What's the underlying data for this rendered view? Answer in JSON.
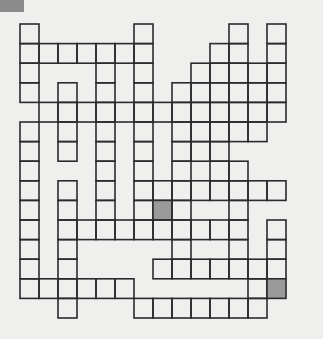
{
  "puzzle": {
    "type": "crossword-grid",
    "cols": 15,
    "rows": 15,
    "origin": [
      20,
      24
    ],
    "cell_w": 19,
    "cell_h": 19.6,
    "line_color": "#2b2b2b",
    "shade_color": "#9a9a9a",
    "corner_marker_color": "#8a8a8a",
    "shaded_cells": [
      [
        7,
        9
      ],
      [
        13,
        13
      ]
    ],
    "cells": [
      [
        0,
        0
      ],
      [
        6,
        0
      ],
      [
        11,
        0
      ],
      [
        13,
        0
      ],
      [
        0,
        1
      ],
      [
        1,
        1
      ],
      [
        2,
        1
      ],
      [
        3,
        1
      ],
      [
        4,
        1
      ],
      [
        5,
        1
      ],
      [
        6,
        1
      ],
      [
        10,
        1
      ],
      [
        11,
        1
      ],
      [
        13,
        1
      ],
      [
        0,
        2
      ],
      [
        4,
        2
      ],
      [
        6,
        2
      ],
      [
        9,
        2
      ],
      [
        10,
        2
      ],
      [
        11,
        2
      ],
      [
        12,
        2
      ],
      [
        13,
        2
      ],
      [
        0,
        3
      ],
      [
        2,
        3
      ],
      [
        4,
        3
      ],
      [
        6,
        3
      ],
      [
        8,
        3
      ],
      [
        9,
        3
      ],
      [
        10,
        3
      ],
      [
        11,
        3
      ],
      [
        12,
        3
      ],
      [
        13,
        3
      ],
      [
        1,
        4
      ],
      [
        2,
        4
      ],
      [
        3,
        4
      ],
      [
        4,
        4
      ],
      [
        5,
        4
      ],
      [
        6,
        4
      ],
      [
        7,
        4
      ],
      [
        8,
        4
      ],
      [
        9,
        4
      ],
      [
        10,
        4
      ],
      [
        11,
        4
      ],
      [
        12,
        4
      ],
      [
        13,
        4
      ],
      [
        0,
        5
      ],
      [
        2,
        5
      ],
      [
        4,
        5
      ],
      [
        6,
        5
      ],
      [
        8,
        5
      ],
      [
        9,
        5
      ],
      [
        10,
        5
      ],
      [
        11,
        5
      ],
      [
        12,
        5
      ],
      [
        0,
        6
      ],
      [
        2,
        6
      ],
      [
        4,
        6
      ],
      [
        6,
        6
      ],
      [
        8,
        6
      ],
      [
        9,
        6
      ],
      [
        10,
        6
      ],
      [
        0,
        7
      ],
      [
        4,
        7
      ],
      [
        6,
        7
      ],
      [
        8,
        7
      ],
      [
        10,
        7
      ],
      [
        11,
        7
      ],
      [
        0,
        8
      ],
      [
        2,
        8
      ],
      [
        4,
        8
      ],
      [
        6,
        8
      ],
      [
        7,
        8
      ],
      [
        8,
        8
      ],
      [
        9,
        8
      ],
      [
        10,
        8
      ],
      [
        11,
        8
      ],
      [
        12,
        8
      ],
      [
        13,
        8
      ],
      [
        0,
        9
      ],
      [
        2,
        9
      ],
      [
        4,
        9
      ],
      [
        6,
        9
      ],
      [
        7,
        9
      ],
      [
        8,
        9
      ],
      [
        11,
        9
      ],
      [
        0,
        10
      ],
      [
        2,
        10
      ],
      [
        3,
        10
      ],
      [
        4,
        10
      ],
      [
        5,
        10
      ],
      [
        6,
        10
      ],
      [
        7,
        10
      ],
      [
        8,
        10
      ],
      [
        9,
        10
      ],
      [
        10,
        10
      ],
      [
        11,
        10
      ],
      [
        13,
        10
      ],
      [
        0,
        11
      ],
      [
        2,
        11
      ],
      [
        8,
        11
      ],
      [
        11,
        11
      ],
      [
        13,
        11
      ],
      [
        0,
        12
      ],
      [
        2,
        12
      ],
      [
        7,
        12
      ],
      [
        8,
        12
      ],
      [
        9,
        12
      ],
      [
        10,
        12
      ],
      [
        11,
        12
      ],
      [
        12,
        12
      ],
      [
        13,
        12
      ],
      [
        0,
        13
      ],
      [
        1,
        13
      ],
      [
        2,
        13
      ],
      [
        3,
        13
      ],
      [
        4,
        13
      ],
      [
        5,
        13
      ],
      [
        12,
        13
      ],
      [
        13,
        13
      ],
      [
        2,
        14
      ],
      [
        6,
        14
      ],
      [
        7,
        14
      ],
      [
        8,
        14
      ],
      [
        9,
        14
      ],
      [
        10,
        14
      ],
      [
        11,
        14
      ],
      [
        12,
        14
      ]
    ]
  }
}
